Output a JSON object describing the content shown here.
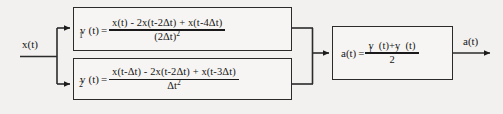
{
  "diagram": {
    "type": "block-diagram",
    "background_color": "#f2f1ef",
    "line_color": "#2b2b2b",
    "text_color": "#161616"
  },
  "signals": {
    "input_label": "x(t)",
    "output_label": "a(t)"
  },
  "blocks": [
    {
      "id": "v1",
      "lhs_var": "v",
      "lhs_subscript": "1",
      "lhs_arg": "(t)",
      "equals": "=",
      "numerator": "x(t) - 2x(t-2Δt) + x(t-4Δt)",
      "denominator_base": "(2Δt)",
      "denominator_exponent": "2"
    },
    {
      "id": "v2",
      "lhs_var": "v",
      "lhs_subscript": "2",
      "lhs_arg": "(t)",
      "equals": "=",
      "numerator": "x(t-Δt) - 2x(t-2Δt) + x(t-3Δt)",
      "denominator_base": "Δt",
      "denominator_exponent": "2"
    },
    {
      "id": "avg",
      "lhs_var": "a(t)",
      "equals": "=",
      "numerator_term1_var": "v",
      "numerator_term1_sub": "1",
      "numerator_term1_arg": "(t)",
      "numerator_plus": "+",
      "numerator_term2_var": "v",
      "numerator_term2_sub": "2",
      "numerator_term2_arg": "(t)",
      "denominator": "2"
    }
  ]
}
